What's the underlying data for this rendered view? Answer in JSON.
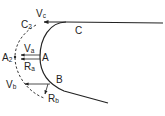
{
  "diagram": {
    "type": "flow-around-blunt-body",
    "colors": {
      "line": "#222222",
      "background": "#ffffff"
    },
    "points": {
      "A": {
        "label": "A"
      },
      "B": {
        "label": "B"
      },
      "C": {
        "label": "C"
      },
      "A2": {
        "main": "A",
        "sub": "2"
      },
      "C2": {
        "main": "C",
        "sub": "2"
      }
    },
    "vectors": {
      "Va": {
        "main": "V",
        "sub": "a"
      },
      "Vb": {
        "main": "V",
        "sub": "b"
      },
      "Vc": {
        "main": "V",
        "sub": "c"
      },
      "Ra": {
        "main": "R",
        "sub": "a"
      },
      "Rb": {
        "main": "R",
        "sub": "b"
      }
    }
  }
}
